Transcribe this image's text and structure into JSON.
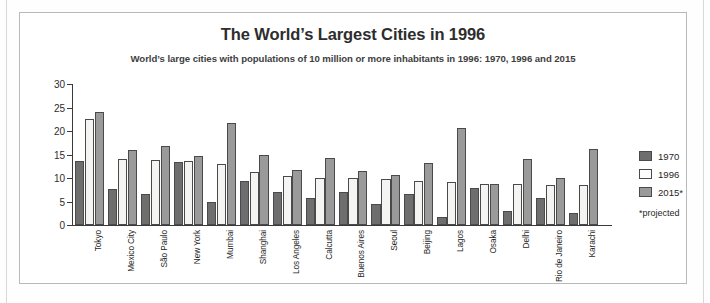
{
  "chart_data": {
    "type": "bar",
    "title": "The World’s Largest Cities in 1996",
    "subtitle": "World’s large cities with populations of 10 million or more inhabitants in 1996: 1970, 1996 and 2015",
    "xlabel": "",
    "ylabel": "",
    "ylim": [
      0,
      30
    ],
    "yticks": [
      0,
      5,
      10,
      15,
      20,
      25,
      30
    ],
    "grid": false,
    "legend_position": "right",
    "categories": [
      "Tokyo",
      "Mexico City",
      "São Paulo",
      "New York",
      "Mumbai",
      "Shanghai",
      "Los Angeles",
      "Calcutta",
      "Buenos Aires",
      "Seoul",
      "Beijing",
      "Lagos",
      "Osaka",
      "Delhi",
      "Rio de Janeiro",
      "Karachi"
    ],
    "series": [
      {
        "name": "1970",
        "color": "#6e6e6e",
        "values": [
          13.6,
          7.6,
          6.7,
          13.4,
          4.8,
          9.3,
          7.1,
          5.8,
          7.0,
          4.4,
          6.7,
          1.6,
          7.8,
          2.9,
          5.7,
          2.5
        ]
      },
      {
        "name": "1996",
        "color": "#f4f4f2",
        "values": [
          22.6,
          14.1,
          13.9,
          13.7,
          13.0,
          11.3,
          10.5,
          10.0,
          9.9,
          9.8,
          9.4,
          9.1,
          8.7,
          8.7,
          8.6,
          8.5
        ]
      },
      {
        "name": "2015*",
        "color": "#9a9a9a",
        "values": [
          24.0,
          15.9,
          16.8,
          14.6,
          21.7,
          14.9,
          11.6,
          14.2,
          11.5,
          10.7,
          13.1,
          20.6,
          8.7,
          14.1,
          10.0,
          16.1
        ]
      }
    ],
    "annotations": [
      "*projected"
    ]
  },
  "legend": {
    "items": [
      {
        "label": "1970"
      },
      {
        "label": "1996"
      },
      {
        "label": "2015*"
      }
    ],
    "note": "*projected"
  }
}
